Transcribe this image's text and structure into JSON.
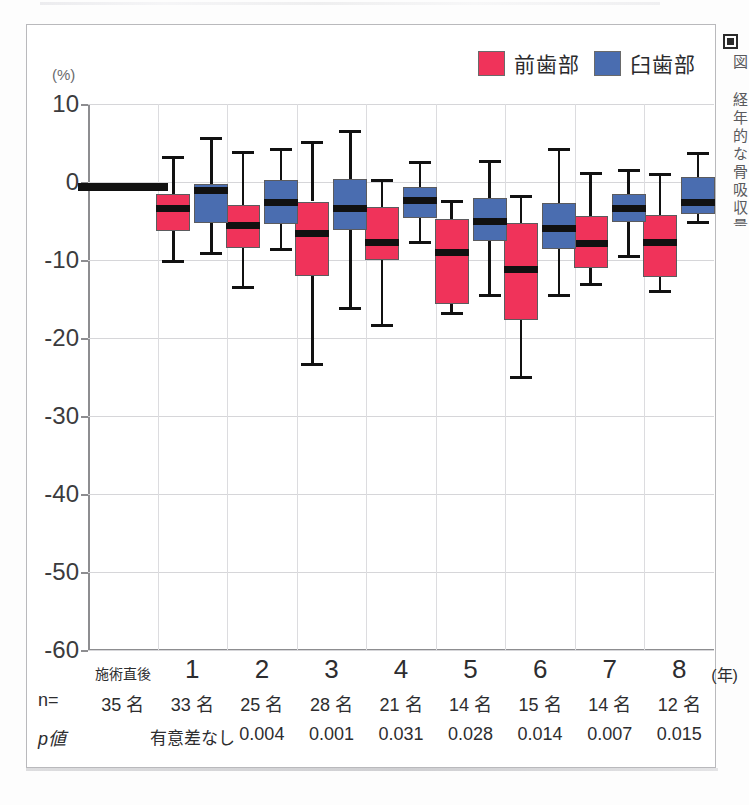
{
  "figure": {
    "unit_label": "(%)",
    "side_caption": "図 経年的な骨吸収量の推移を示す",
    "legend": [
      {
        "label": "前歯部",
        "color": "#f0335a",
        "swatch": "pink-swatch"
      },
      {
        "label": "臼歯部",
        "color": "#4a6db0",
        "swatch": "blue-swatch"
      }
    ]
  },
  "axis": {
    "x_unit": "(年)",
    "y_ticks": [
      "10",
      "0",
      "-10",
      "-20",
      "-30",
      "-40",
      "-50",
      "-60"
    ],
    "row_label_n": "n=",
    "row_label_p": "p値"
  },
  "chart_data": {
    "type": "box",
    "title": "",
    "xlabel": "(年)",
    "ylabel": "(%)",
    "ylim": [
      -60,
      10
    ],
    "ytick_step": 10,
    "grid": true,
    "legend_position": "top-right",
    "categories": [
      "施術直後",
      "1",
      "2",
      "3",
      "4",
      "5",
      "6",
      "7",
      "8"
    ],
    "n_counts": [
      "35 名",
      "33 名",
      "25 名",
      "28 名",
      "21 名",
      "14 名",
      "15 名",
      "14 名",
      "12 名"
    ],
    "p_values": [
      "",
      "有意差なし",
      "0.004",
      "0.001",
      "0.031",
      "0.028",
      "0.014",
      "0.007",
      "0.015"
    ],
    "series": [
      {
        "name": "前歯部",
        "color": "#f0335a",
        "boxes": [
          {
            "category": "施術直後",
            "flat": true,
            "median": -0.7
          },
          {
            "category": "1",
            "whisker_low": -10.2,
            "q1": -6.3,
            "median": -3.4,
            "q3": -1.6,
            "whisker_high": 3.1
          },
          {
            "category": "2",
            "whisker_low": -13.5,
            "q1": -8.4,
            "median": -5.6,
            "q3": -3.0,
            "whisker_high": 3.8
          },
          {
            "category": "3",
            "whisker_low": -23.4,
            "q1": -12.1,
            "median": -6.6,
            "q3": -2.5,
            "whisker_high": 5.1
          },
          {
            "category": "4",
            "whisker_low": -18.4,
            "q1": -10.0,
            "median": -7.7,
            "q3": -3.2,
            "whisker_high": 0.2
          },
          {
            "category": "5",
            "whisker_low": -16.9,
            "q1": -15.7,
            "median": -9.1,
            "q3": -4.7,
            "whisker_high": -2.5
          },
          {
            "category": "6",
            "whisker_low": -25.0,
            "q1": -17.7,
            "median": -11.2,
            "q3": -5.3,
            "whisker_high": -1.9
          },
          {
            "category": "7",
            "whisker_low": -13.2,
            "q1": -11.0,
            "median": -7.9,
            "q3": -4.3,
            "whisker_high": 1.1
          },
          {
            "category": "8",
            "whisker_low": -14.1,
            "q1": -12.2,
            "median": -7.7,
            "q3": -4.2,
            "whisker_high": 0.9
          }
        ]
      },
      {
        "name": "臼歯部",
        "color": "#4a6db0",
        "boxes": [
          {
            "category": "1",
            "whisker_low": -9.2,
            "q1": -5.2,
            "median": -1.1,
            "q3": -0.2,
            "whisker_high": 5.6
          },
          {
            "category": "2",
            "whisker_low": -8.6,
            "q1": -5.4,
            "median": -2.6,
            "q3": 0.2,
            "whisker_high": 4.2
          },
          {
            "category": "3",
            "whisker_low": -16.2,
            "q1": -6.2,
            "median": -3.4,
            "q3": 0.4,
            "whisker_high": 6.5
          },
          {
            "category": "4",
            "whisker_low": -7.7,
            "q1": -4.6,
            "median": -2.4,
            "q3": -0.7,
            "whisker_high": 2.5
          },
          {
            "category": "5",
            "whisker_low": -14.6,
            "q1": -7.6,
            "median": -5.1,
            "q3": -2.0,
            "whisker_high": 2.6
          },
          {
            "category": "6",
            "whisker_low": -14.6,
            "q1": -8.6,
            "median": -6.0,
            "q3": -2.7,
            "whisker_high": 4.2
          },
          {
            "category": "7",
            "whisker_low": -9.6,
            "q1": -5.1,
            "median": -3.4,
            "q3": -1.6,
            "whisker_high": 1.5
          },
          {
            "category": "8",
            "whisker_low": -5.2,
            "q1": -4.1,
            "median": -2.6,
            "q3": 0.6,
            "whisker_high": 3.6
          }
        ]
      }
    ]
  }
}
